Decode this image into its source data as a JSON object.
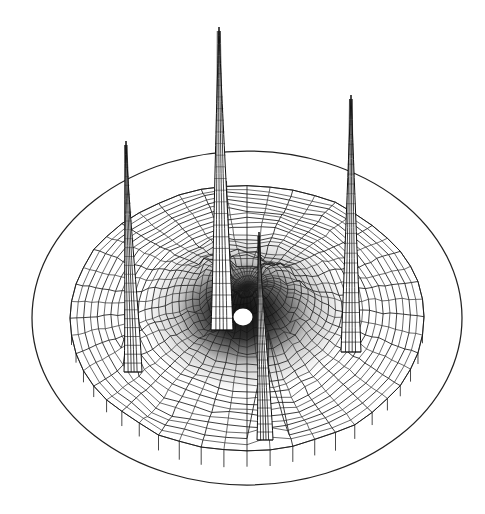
{
  "figure": {
    "kind": "3d-surface-mesh-plot",
    "title": "",
    "background_color": "#ffffff",
    "ink_color": "#1a1a1a",
    "canvas": {
      "width": 485,
      "height": 514
    },
    "rendering": "monochrome scanned halftone wireframe, no axes, no labels, no legend"
  },
  "chart_data": {
    "type": "surface",
    "title": "",
    "subtitle": "",
    "xlabel": "",
    "ylabel": "",
    "zlabel": "",
    "grid": true,
    "legend": false,
    "legend_position": "none",
    "projection": {
      "style": "orthographic-3d-wireframe",
      "elevation_deg": 32,
      "azimuth_deg": 35,
      "domain_shape": "disk"
    },
    "domain": {
      "type": "polar-disk",
      "radius": 1.0,
      "radial_divisions": 26,
      "angular_divisions": 48
    },
    "base_plane": {
      "outline": "ellipse",
      "center_px": [
        247,
        318
      ],
      "radius_x_px": 215,
      "radius_y_px": 167
    },
    "surface_sheet": {
      "center_px": [
        247,
        318
      ],
      "radius_x_px": 177,
      "radius_y_px": 133,
      "rim_height_px": 8,
      "skirt_depth_px": 14
    },
    "peaks": [
      {
        "label": "peak-back-center",
        "apex_px": [
          219,
          27
        ],
        "base_px": [
          222,
          330
        ],
        "height_px": 303,
        "half_width_px": 11,
        "relative_height": 1.0,
        "polar_r": 0.35,
        "polar_theta_deg": 95
      },
      {
        "label": "peak-right",
        "apex_px": [
          351,
          95
        ],
        "base_px": [
          351,
          352
        ],
        "height_px": 257,
        "half_width_px": 10,
        "relative_height": 0.85,
        "polar_r": 0.52,
        "polar_theta_deg": 20
      },
      {
        "label": "peak-left",
        "apex_px": [
          126,
          141
        ],
        "base_px": [
          133,
          372
        ],
        "height_px": 231,
        "half_width_px": 9,
        "relative_height": 0.76,
        "polar_r": 0.58,
        "polar_theta_deg": 162
      },
      {
        "label": "peak-front-center",
        "apex_px": [
          259,
          232
        ],
        "base_px": [
          265,
          440
        ],
        "height_px": 208,
        "half_width_px": 8,
        "relative_height": 0.69,
        "polar_r": 0.3,
        "polar_theta_deg": 285
      }
    ],
    "central_feature": {
      "label": "center-hole",
      "description": "white unfilled blob at the dense dark core of the surface",
      "center_px": [
        243,
        317
      ],
      "radius_x_px": 9,
      "radius_y_px": 8
    },
    "dark_core": {
      "description": "high-density mesh region around origin rendered nearly solid black",
      "center_px": [
        243,
        315
      ],
      "radius_x_px": 62,
      "radius_y_px": 50
    },
    "notes": [
      "Four sharp narrow spikes rise from an otherwise gently undulating disk-shaped surface.",
      "Mesh density increases toward the center producing a solid dark core.",
      "A thin elliptical base-plane outline surrounds the surface sheet.",
      "Short vertical skirt ticks hang from the front rim of the surface."
    ]
  }
}
